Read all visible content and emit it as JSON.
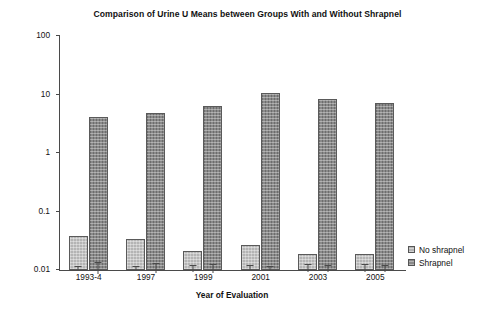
{
  "chart_data": {
    "type": "bar",
    "title": "Comparison of Urine U Means between Groups With and Without Shrapnel",
    "xlabel": "Year of Evaluation",
    "ylabel": "Urine uranium (µg U/g creatinine)",
    "yscale": "log",
    "ylim": [
      0.01,
      100
    ],
    "ytick_labels": [
      "100",
      "10",
      "1",
      "0.1",
      "0.01"
    ],
    "ytick_values": [
      100,
      10,
      1,
      0.1,
      0.01
    ],
    "grid": false,
    "legend_position": "right",
    "categories": [
      "1993-4",
      "1997",
      "1999",
      "2001",
      "2003",
      "2005"
    ],
    "series": [
      {
        "name": "No shrapnel",
        "color": "#b4b4b4",
        "values": [
          0.038,
          0.034,
          0.021,
          0.027,
          0.019,
          0.019
        ],
        "err_low": [
          0.035,
          0.032,
          0.019,
          0.025,
          0.017,
          0.017
        ],
        "err_high": [
          0.041,
          0.037,
          0.024,
          0.03,
          0.022,
          0.022
        ]
      },
      {
        "name": "Shrapnel",
        "color": "#8a8a8a",
        "values": [
          4.2,
          4.9,
          6.4,
          10.8,
          8.3,
          7.2
        ],
        "err_low": [
          3.5,
          4.2,
          5.5,
          9.8,
          7.5,
          6.4
        ],
        "err_high": [
          5.3,
          6.0,
          7.6,
          11.8,
          9.3,
          8.2
        ]
      }
    ]
  },
  "axis": {
    "y_labels": [
      "100",
      "10",
      "1",
      "0.1",
      "0.01"
    ],
    "x_labels": [
      "1993-4",
      "1997",
      "1999",
      "2001",
      "2003",
      "2005"
    ],
    "y_title": "Urine uranium (µg U/g creatinine)",
    "x_title": "Year of Evaluation"
  },
  "legend": {
    "items": [
      {
        "label": "No shrapnel",
        "swatch": "no-shrapnel"
      },
      {
        "label": "Shrapnel",
        "swatch": "shrapnel"
      }
    ]
  }
}
